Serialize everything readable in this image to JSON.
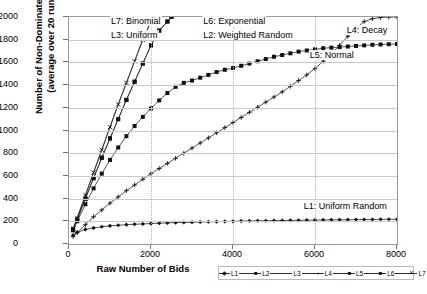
{
  "chart_data": {
    "type": "line",
    "title": "",
    "xlabel": "Raw Number of Bids",
    "ylabel_line1": "Number of Non-Dominated Bids",
    "ylabel_line2": "(average over 20 runs)",
    "xlim": [
      0,
      8000
    ],
    "ylim": [
      0,
      2000
    ],
    "xticks": [
      0,
      2000,
      4000,
      6000,
      8000
    ],
    "yticks": [
      0,
      200,
      400,
      600,
      800,
      1000,
      1200,
      1400,
      1600,
      1800,
      2000
    ],
    "grid": true,
    "legend_position": "bottom-right",
    "annotations": [
      {
        "text": "L7: Binomial",
        "x": 1000,
        "y": 1960
      },
      {
        "text": "L3: Uniform",
        "x": 1000,
        "y": 1830
      },
      {
        "text": "L6: Exponential",
        "x": 3250,
        "y": 1960
      },
      {
        "text": "L2: Weighted Random",
        "x": 3250,
        "y": 1830
      },
      {
        "text": "L4: Decay",
        "x": 6750,
        "y": 1880
      },
      {
        "text": "L5: Normal",
        "x": 5850,
        "y": 1660
      },
      {
        "text": "L1: Uniform Random",
        "x": 5700,
        "y": 330
      }
    ],
    "series": [
      {
        "name": "L1",
        "label": "L1: Uniform Random",
        "marker": "diamond",
        "x": [
          100,
          200,
          400,
          600,
          800,
          1000,
          1200,
          1400,
          1600,
          1800,
          2000,
          2200,
          2400,
          2600,
          2800,
          3000,
          3200,
          3400,
          3600,
          3800,
          4000,
          4200,
          4400,
          4600,
          4800,
          5000,
          5200,
          5400,
          5600,
          5800,
          6000,
          6200,
          6400,
          6600,
          6800,
          7000,
          7200,
          7400,
          7600,
          7800,
          8000
        ],
        "y": [
          78,
          103,
          128,
          142,
          152,
          160,
          165,
          170,
          174,
          177,
          180,
          183,
          186,
          188,
          190,
          192,
          194,
          196,
          197,
          199,
          200,
          202,
          203,
          204,
          205,
          206,
          207,
          208,
          209,
          210,
          211,
          212,
          213,
          213,
          214,
          215,
          216,
          216,
          217,
          218,
          218
        ]
      },
      {
        "name": "L2",
        "label": "L2: Weighted Random",
        "marker": "square",
        "x": [
          100,
          200,
          400,
          600,
          800,
          1000,
          1200,
          1400,
          1600,
          1800,
          2000,
          2200,
          2400,
          2500
        ],
        "y": [
          130,
          215,
          400,
          580,
          760,
          930,
          1100,
          1270,
          1430,
          1590,
          1750,
          1880,
          1960,
          2000
        ]
      },
      {
        "name": "L3",
        "label": "L3: Uniform",
        "marker": "line",
        "x": [
          100,
          200,
          400,
          600,
          800,
          1000,
          1200,
          1400,
          1600,
          1800,
          2000,
          2100
        ],
        "y": [
          135,
          230,
          430,
          630,
          830,
          1030,
          1230,
          1420,
          1610,
          1800,
          1960,
          2000
        ]
      },
      {
        "name": "L4",
        "label": "L4: Decay",
        "marker": "plus",
        "x": [
          100,
          200,
          400,
          600,
          800,
          1000,
          1200,
          1400,
          1600,
          1800,
          2000,
          2200,
          2400,
          2600,
          2800,
          3000,
          3200,
          3400,
          3600,
          3800,
          4000,
          4200,
          4400,
          4600,
          4800,
          5000,
          5200,
          5400,
          5600,
          5800,
          6000,
          6200,
          6400,
          6600,
          6800,
          7000,
          7200,
          7400,
          7600,
          7800,
          8000
        ],
        "y": [
          65,
          100,
          170,
          240,
          300,
          360,
          415,
          470,
          520,
          570,
          620,
          665,
          710,
          755,
          800,
          845,
          890,
          935,
          980,
          1025,
          1070,
          1115,
          1160,
          1205,
          1250,
          1295,
          1340,
          1390,
          1440,
          1490,
          1545,
          1610,
          1680,
          1750,
          1830,
          1900,
          1960,
          1985,
          1995,
          2000,
          2000
        ]
      },
      {
        "name": "L5",
        "label": "L5: Normal",
        "marker": "square",
        "x": [
          100,
          200,
          400,
          600,
          800,
          1000,
          1200,
          1400,
          1600,
          1800,
          2000,
          2200,
          2400,
          2600,
          2800,
          3000,
          3200,
          3400,
          3600,
          3800,
          4000,
          4200,
          4400,
          4600,
          4800,
          5000,
          5200,
          5400,
          5600,
          5800,
          6000,
          6200,
          6400,
          6600,
          6800,
          7000,
          7200,
          7400,
          7600,
          7800,
          8000
        ],
        "y": [
          120,
          200,
          350,
          490,
          620,
          740,
          850,
          950,
          1040,
          1120,
          1195,
          1265,
          1330,
          1385,
          1420,
          1440,
          1465,
          1490,
          1515,
          1535,
          1550,
          1570,
          1590,
          1610,
          1630,
          1650,
          1665,
          1680,
          1695,
          1705,
          1715,
          1725,
          1730,
          1735,
          1740,
          1745,
          1750,
          1755,
          1758,
          1760,
          1762
        ]
      },
      {
        "name": "L6",
        "label": "L6: Exponential",
        "marker": "square-solid",
        "x": [
          100,
          200,
          400,
          600,
          800,
          1000,
          1200,
          1400,
          1600,
          1800,
          2000,
          2200,
          2400,
          2500
        ],
        "y": [
          130,
          215,
          400,
          580,
          760,
          930,
          1100,
          1270,
          1430,
          1590,
          1750,
          1880,
          1960,
          2000
        ]
      },
      {
        "name": "L7",
        "label": "L7: Binomial",
        "marker": "x",
        "x": [
          100,
          200,
          400,
          600,
          800,
          1000,
          1200,
          1400,
          1600,
          1800,
          2000,
          2100
        ],
        "y": [
          135,
          230,
          430,
          630,
          830,
          1030,
          1230,
          1420,
          1610,
          1800,
          1960,
          2000
        ]
      }
    ]
  },
  "legend": {
    "items": [
      {
        "label": "L1",
        "marker": "diamond"
      },
      {
        "label": "L2",
        "marker": "square"
      },
      {
        "label": "L3",
        "marker": "line"
      },
      {
        "label": "L4",
        "marker": "plus"
      },
      {
        "label": "L5",
        "marker": "square"
      },
      {
        "label": "L6",
        "marker": "square-solid"
      },
      {
        "label": "L7",
        "marker": "x"
      }
    ]
  }
}
